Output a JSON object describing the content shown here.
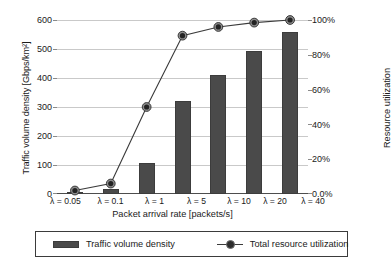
{
  "chart_data": {
    "type": "bar",
    "title": "",
    "categories": [
      "λ = 0.05",
      "λ = 0.1",
      "λ = 1",
      "λ = 5",
      "λ = 10",
      "λ = 20",
      "λ = 40"
    ],
    "xlabel": "Packet arrival rate [packets/s]",
    "ylabel": "Traffic volume density [Gbps/km²]",
    "y2label": "Resource utilization",
    "ylim": [
      0,
      600
    ],
    "y2lim": [
      0,
      100
    ],
    "yticks": [
      "0",
      "100",
      "200",
      "300",
      "400",
      "500",
      "600"
    ],
    "ytick_values": [
      0,
      100,
      200,
      300,
      400,
      500,
      600
    ],
    "y2ticks": [
      "0.0%",
      "20%",
      "40%",
      "60%",
      "80%",
      "100%"
    ],
    "y2tick_values": [
      0,
      20,
      40,
      60,
      80,
      100
    ],
    "grid": true,
    "legend_position": "bottom",
    "series": [
      {
        "name": "Traffic volume density",
        "type": "bar",
        "axis": "left",
        "unit": "Gbps/km²",
        "color": "#4a4a4a",
        "values": [
          5,
          18,
          107,
          320,
          412,
          493,
          560
        ]
      },
      {
        "name": "Total resource utilization",
        "type": "line",
        "axis": "right",
        "unit": "%",
        "color": "#2e2e2e",
        "marker": "circle",
        "values": [
          2,
          6,
          50,
          91,
          96,
          98.5,
          100
        ]
      }
    ]
  },
  "legend": {
    "items": [
      {
        "label": "Traffic volume density",
        "marker": "bar-swatch"
      },
      {
        "label": "Total resource utilization",
        "marker": "line-marker"
      }
    ]
  }
}
